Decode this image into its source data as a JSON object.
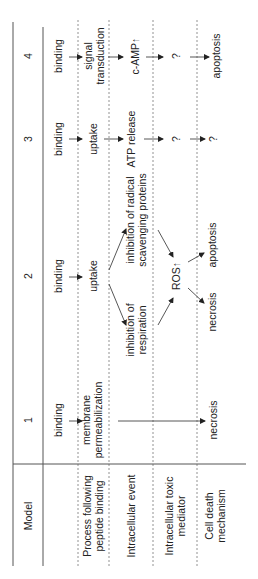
{
  "table": {
    "header_label": "Model",
    "row_labels": [
      [
        "Process following",
        "peptide binding"
      ],
      [
        "Intracellular event"
      ],
      [
        "Intracellular toxic",
        "mediator"
      ],
      [
        "Cell death",
        "mechanism"
      ]
    ],
    "models": [
      {
        "number": "1",
        "binding": "binding",
        "process": [
          "membrane",
          "permeabilization"
        ],
        "event": "",
        "mediator": "",
        "death": "necrosis"
      },
      {
        "number": "2",
        "binding": "binding",
        "process": [
          "uptake"
        ],
        "event_a": [
          "inhibition of",
          "respiration"
        ],
        "event_b": [
          "inhibition of radical",
          "scavenging proteins"
        ],
        "mediator": "ROS↑",
        "death_a": "necrosis",
        "death_b": "apoptosis"
      },
      {
        "number": "3",
        "binding": "binding",
        "process": [
          "uptake"
        ],
        "event": "ATP release",
        "mediator": "?",
        "death": "?"
      },
      {
        "number": "4",
        "binding": "binding",
        "process": [
          "signal",
          "transduction"
        ],
        "event": "c-AMP↑",
        "mediator": "?",
        "death": "apoptosis"
      }
    ]
  }
}
